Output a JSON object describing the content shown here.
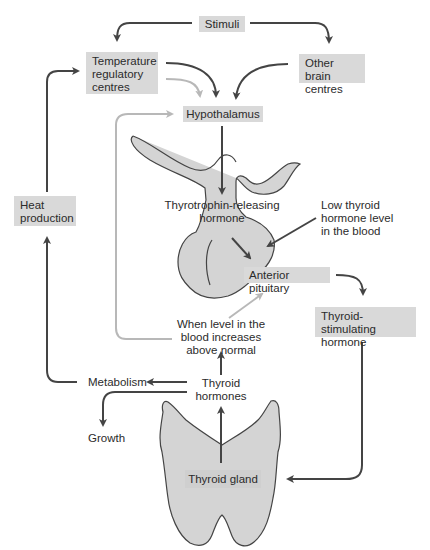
{
  "diagram": {
    "type": "flowchart",
    "topic": "Regulation of thyroid hormone secretion (negative feedback)",
    "nodes": {
      "stimuli": "Stimuli",
      "temperature_centres": "Temperature regulatory centres",
      "other_brain_centres": "Other brain centres",
      "hypothalamus": "Hypothalamus",
      "trh": "Thyrotrophin-releasing hormone",
      "low_thyroid": "Low thyroid hormone level in the blood",
      "anterior_pituitary": "Anterior pituitary",
      "tsh": "Thyroid-stimulating hormone",
      "heat_production": "Heat production",
      "level_increases": "When level in the blood increases above normal",
      "metabolism": "Metabolism",
      "thyroid_hormones": "Thyroid hormones",
      "growth": "Growth",
      "thyroid_gland": "Thyroid gland"
    },
    "lines": {
      "temperature_centres": [
        "Temperature",
        "regulatory",
        "centres"
      ],
      "other_brain_centres": [
        "Other brain",
        "centres"
      ],
      "trh": [
        "Thyrotrophin-releasing",
        "hormone"
      ],
      "low_thyroid": [
        "Low thyroid",
        "hormone level",
        "in the blood"
      ],
      "tsh": [
        "Thyroid-stimulating",
        "hormone"
      ],
      "heat_production": [
        "Heat",
        "production"
      ],
      "level_increases": [
        "When level in the",
        "blood increases",
        "above normal"
      ],
      "thyroid_hormones": [
        "Thyroid",
        "hormones"
      ]
    },
    "edges": [
      {
        "from": "Stimuli",
        "to": "Temperature regulatory centres",
        "style": "dark"
      },
      {
        "from": "Stimuli",
        "to": "Other brain centres",
        "style": "dark"
      },
      {
        "from": "Temperature regulatory centres",
        "to": "Hypothalamus",
        "style": "dark"
      },
      {
        "from": "Temperature regulatory centres",
        "to": "Hypothalamus",
        "style": "light (inhibitory)"
      },
      {
        "from": "Other brain centres",
        "to": "Hypothalamus",
        "style": "dark"
      },
      {
        "from": "Hypothalamus",
        "to": "Thyrotrophin-releasing hormone",
        "style": "dark"
      },
      {
        "from": "Thyrotrophin-releasing hormone",
        "to": "Anterior pituitary",
        "style": "dark"
      },
      {
        "from": "Low thyroid hormone level in the blood",
        "to": "Anterior pituitary",
        "style": "dark"
      },
      {
        "from": "Anterior pituitary",
        "to": "Thyroid-stimulating hormone",
        "style": "dark"
      },
      {
        "from": "Thyroid-stimulating hormone",
        "to": "Thyroid gland",
        "style": "dark"
      },
      {
        "from": "Thyroid gland",
        "to": "Thyroid hormones",
        "style": "dark"
      },
      {
        "from": "Thyroid hormones",
        "to": "When level in the blood increases above normal",
        "style": "dark"
      },
      {
        "from": "When level in the blood increases above normal",
        "to": "Anterior pituitary",
        "style": "light (inhibitory)"
      },
      {
        "from": "When level in the blood increases above normal",
        "to": "Hypothalamus",
        "style": "light (inhibitory)"
      },
      {
        "from": "Thyroid hormones",
        "to": "Metabolism",
        "style": "dark"
      },
      {
        "from": "Thyroid hormones",
        "to": "Growth",
        "style": "dark"
      },
      {
        "from": "Metabolism",
        "to": "Heat production",
        "style": "dark"
      },
      {
        "from": "Heat production",
        "to": "Temperature regulatory centres",
        "style": "dark"
      }
    ],
    "colors": {
      "box_fill": "#d9d9d9",
      "organ_fill": "#d4d4d4",
      "dark_arrow": "#444444",
      "light_arrow": "#b8b8b8",
      "text": "#2b2b2b"
    }
  }
}
